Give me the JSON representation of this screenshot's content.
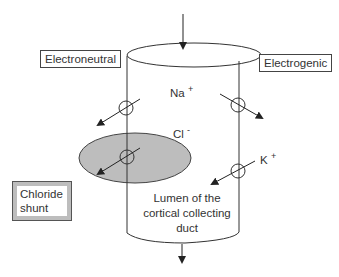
{
  "labels": {
    "electroneutral": "Electroneutral",
    "electrogenic": "Electrogenic",
    "sodium": "Na",
    "sodium_charge": "+",
    "chloride": "Cl",
    "chloride_charge": "-",
    "potassium": "K",
    "potassium_charge": "+",
    "chloride_shunt_line1": "Chloride",
    "chloride_shunt_line2": "shunt",
    "lumen_line1": "Lumen of the",
    "lumen_line2": "cortical collecting",
    "lumen_line3": "duct"
  },
  "colors": {
    "line": "#333333",
    "shunt_fill": "#bdbdbd",
    "background": "#ffffff"
  }
}
